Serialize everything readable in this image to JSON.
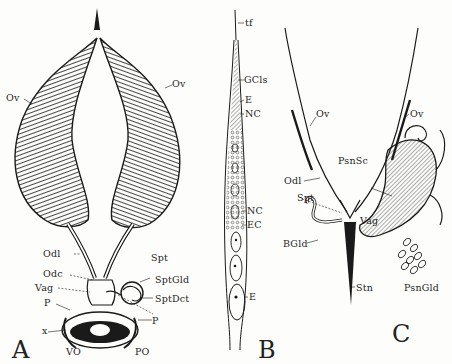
{
  "figure": {
    "panels": [
      {
        "id": "A",
        "letter": "A",
        "labels": {
          "ov_left": "Ov",
          "ov_right": "Ov",
          "odl": "Odl",
          "odc": "Odc",
          "vag": "Vag",
          "p_left": "P",
          "x": "x",
          "spt": "Spt",
          "sptgld": "SptGld",
          "sptdct": "SptDct",
          "p_right": "P",
          "vo": "VO",
          "po": "PO"
        }
      },
      {
        "id": "B",
        "letter": "B",
        "labels": {
          "tf": "tf",
          "gcls": "GCls",
          "e_top": "E",
          "nc_top": "NC",
          "nc_bottom": "NC",
          "ec": "EC",
          "e_bottom": "E"
        }
      },
      {
        "id": "C",
        "letter": "C",
        "labels": {
          "ov_left": "Ov",
          "ov_right": "Ov",
          "psnsc": "PsnSc",
          "odl": "Odl",
          "spt": "Spt",
          "vag": "Vag",
          "bgld": "BGld",
          "stn": "Stn",
          "psngld": "PsnGld"
        }
      }
    ],
    "colors": {
      "ink": "#1a1a1a",
      "paper": "#fdfdfb"
    }
  }
}
